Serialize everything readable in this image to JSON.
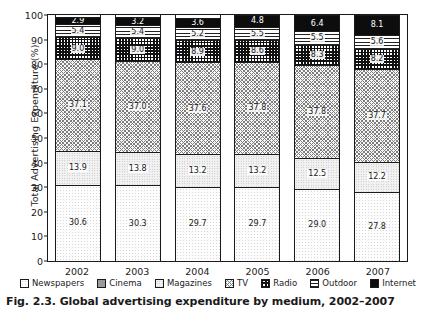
{
  "caption": "Fig. 2.3. Global advertising expenditure by medium, 2002–2007",
  "chart_data": {
    "type": "bar",
    "subtype": "stacked-bar-100-percent",
    "title": "Global advertising expenditure by medium, 2002–2007",
    "xlabel": "",
    "ylabel": "Total Advertising Expenditure (%)",
    "ylim": [
      0,
      100
    ],
    "yticks": [
      0,
      10,
      20,
      30,
      40,
      50,
      60,
      70,
      80,
      90,
      100
    ],
    "ytick_labels": [
      "0",
      "10",
      "20",
      "30",
      "40",
      "50",
      "60",
      "70",
      "80",
      "90",
      "100"
    ],
    "grid": false,
    "legend_position": "bottom",
    "categories": [
      "2002",
      "2003",
      "2004",
      "2005",
      "2006",
      "2007"
    ],
    "stack_order_bottom_to_top": [
      "Newspapers",
      "Cinema",
      "Magazines",
      "TV",
      "Radio",
      "Outdoor",
      "Internet"
    ],
    "series": [
      {
        "name": "Newspapers",
        "fill": "newspapers",
        "color": "#fdfdfd",
        "values": [
          30.6,
          30.3,
          29.7,
          29.7,
          29.0,
          27.8
        ],
        "labels": [
          "30.6",
          "30.3",
          "29.7",
          "29.7",
          "29.0",
          "27.8"
        ]
      },
      {
        "name": "Cinema",
        "fill": "cinema",
        "color": "#9a9a9a",
        "values": [
          0.4,
          0.4,
          0.4,
          0.4,
          0.4,
          0.4
        ],
        "labels": [
          "0.4",
          "0.4",
          "0.4",
          "0.4",
          "0.4",
          "0.4"
        ]
      },
      {
        "name": "Magazines",
        "fill": "magazines",
        "color": "#f2f2f2",
        "values": [
          13.9,
          13.8,
          13.2,
          13.2,
          12.5,
          12.2
        ],
        "labels": [
          "13.9",
          "13.8",
          "13.2",
          "13.2",
          "12.5",
          "12.2"
        ]
      },
      {
        "name": "TV",
        "fill": "tv",
        "color": "#f7f7f7",
        "values": [
          37.1,
          37.0,
          37.6,
          37.8,
          37.8,
          37.7
        ],
        "labels": [
          "37.1",
          "37.0",
          "37.6",
          "37.8",
          "37.8",
          "37.7"
        ]
      },
      {
        "name": "Radio",
        "fill": "radio",
        "color": "#ffffff",
        "values": [
          9.0,
          9.0,
          8.9,
          8.6,
          8.3,
          8.2
        ],
        "labels": [
          "9.0",
          "9.0",
          "8.9",
          "8.6",
          "8.3",
          "8.2"
        ]
      },
      {
        "name": "Outdoor",
        "fill": "outdoor",
        "color": "#ffffff",
        "values": [
          5.4,
          5.4,
          5.2,
          5.5,
          5.5,
          5.6
        ],
        "labels": [
          "5.4",
          "5.4",
          "5.2",
          "5.5",
          "5.5",
          "5.6"
        ]
      },
      {
        "name": "Internet",
        "fill": "internet",
        "color": "#0d0d0d",
        "values": [
          2.9,
          3.2,
          3.6,
          4.8,
          6.4,
          8.1
        ],
        "labels": [
          "2.9",
          "3.2",
          "3.6",
          "4.8",
          "6.4",
          "8.1"
        ]
      }
    ]
  },
  "legend": {
    "items": [
      {
        "label": "Newspapers",
        "fill": "newspapers"
      },
      {
        "label": "Cinema",
        "fill": "cinema"
      },
      {
        "label": "Magazines",
        "fill": "magazines"
      },
      {
        "label": "TV",
        "fill": "tv"
      },
      {
        "label": "Radio",
        "fill": "radio"
      },
      {
        "label": "Outdoor",
        "fill": "outdoor"
      },
      {
        "label": "Internet",
        "fill": "internet"
      }
    ]
  },
  "colors": {
    "axis": "#1a1a1a",
    "background": "#ffffff",
    "text": "#1a1a1a"
  }
}
